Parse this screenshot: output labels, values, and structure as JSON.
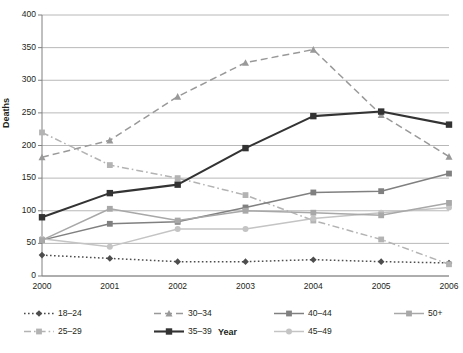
{
  "chart_data": {
    "type": "line",
    "title": "",
    "xlabel": "Year",
    "ylabel": "Deaths",
    "categories": [
      "2000",
      "2001",
      "2002",
      "2003",
      "2004",
      "2005",
      "2006"
    ],
    "x": [
      2000,
      2001,
      2002,
      2003,
      2004,
      2005,
      2006
    ],
    "ylim": [
      0,
      400
    ],
    "yticks": [
      0,
      50,
      100,
      150,
      200,
      250,
      300,
      350,
      400
    ],
    "grid": "horizontal",
    "legend_position": "bottom",
    "series": [
      {
        "name": "18–24",
        "values": [
          32,
          27,
          22,
          22,
          25,
          22,
          20
        ],
        "color": "#4d4d4d",
        "line_style": "dotted",
        "marker": "diamond"
      },
      {
        "name": "25–29",
        "values": [
          220,
          170,
          150,
          124,
          85,
          56,
          18
        ],
        "color": "#b3b3b3",
        "line_style": "dashdot",
        "marker": "square"
      },
      {
        "name": "30–34",
        "values": [
          182,
          208,
          275,
          327,
          347,
          247,
          183
        ],
        "color": "#999999",
        "line_style": "dashed",
        "marker": "triangle"
      },
      {
        "name": "35–39",
        "values": [
          90,
          127,
          140,
          196,
          245,
          252,
          232
        ],
        "color": "#333333",
        "line_style": "solid",
        "marker": "square"
      },
      {
        "name": "40–44",
        "values": [
          55,
          80,
          83,
          105,
          128,
          130,
          157
        ],
        "color": "#808080",
        "line_style": "solid",
        "marker": "square"
      },
      {
        "name": "45–49",
        "values": [
          57,
          45,
          72,
          72,
          88,
          97,
          105
        ],
        "color": "#c4c4c4",
        "line_style": "solid",
        "marker": "circle"
      },
      {
        "name": "50+",
        "values": [
          55,
          103,
          85,
          100,
          97,
          93,
          112
        ],
        "color": "#a8a8a8",
        "line_style": "solid",
        "marker": "square"
      }
    ]
  },
  "axes": {
    "y_title": "Deaths",
    "x_title": "Year",
    "y_tick_labels": [
      "400",
      "350",
      "300",
      "250",
      "200",
      "150",
      "100",
      "50",
      "0"
    ],
    "x_tick_labels": [
      "2000",
      "2001",
      "2002",
      "2003",
      "2004",
      "2005",
      "2006"
    ]
  },
  "legend": {
    "items": [
      {
        "label": "18–24"
      },
      {
        "label": "25–29"
      },
      {
        "label": "30–34"
      },
      {
        "label": "35–39"
      },
      {
        "label": "40–44"
      },
      {
        "label": "45–49"
      },
      {
        "label": "50+"
      }
    ]
  },
  "colors": {
    "grid": "#a6a6a6",
    "axis": "#808080",
    "text": "#231f20",
    "background": "#ffffff"
  }
}
